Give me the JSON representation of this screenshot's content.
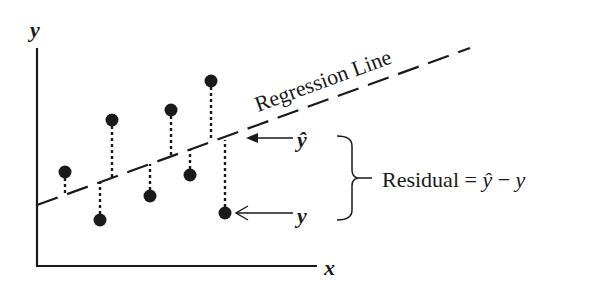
{
  "diagram": {
    "axes": {
      "x_label": "x",
      "y_label": "y"
    },
    "regression_line_label": "Regression Line",
    "annotations": {
      "predicted_label": "ŷ",
      "observed_label": "y",
      "residual_label": "Residual = ",
      "residual_formula_yhat": "ŷ",
      "residual_formula_minus": " − ",
      "residual_formula_y": "y"
    },
    "colors": {
      "ink": "#1a1a1a",
      "background": "#ffffff"
    },
    "points": [
      {
        "cx": 65,
        "cy": 172,
        "line_y": 194
      },
      {
        "cx": 100,
        "cy": 220,
        "line_y": 181
      },
      {
        "cx": 112,
        "cy": 120,
        "line_y": 177
      },
      {
        "cx": 150,
        "cy": 196,
        "line_y": 163
      },
      {
        "cx": 171,
        "cy": 110,
        "line_y": 155
      },
      {
        "cx": 190,
        "cy": 175,
        "line_y": 150
      },
      {
        "cx": 211,
        "cy": 81,
        "line_y": 140
      },
      {
        "cx": 225,
        "cy": 213,
        "line_y": 140
      }
    ]
  }
}
